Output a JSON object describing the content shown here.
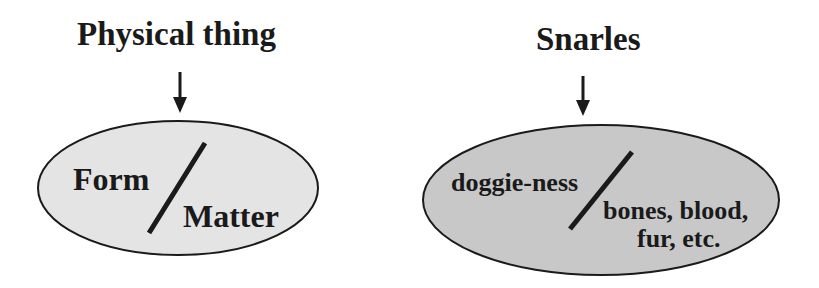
{
  "diagrams": [
    {
      "title": "Physical thing",
      "left_label": "Form",
      "right_label": "Matter",
      "fill": "#e4e4e4"
    },
    {
      "title": "Snarles",
      "left_label": "doggie-ness",
      "right_label_line1": "bones, blood,",
      "right_label_line2": "fur, etc.",
      "fill": "#c8c8c8"
    }
  ],
  "colors": {
    "stroke": "#1a1a1a",
    "background": "#ffffff"
  }
}
